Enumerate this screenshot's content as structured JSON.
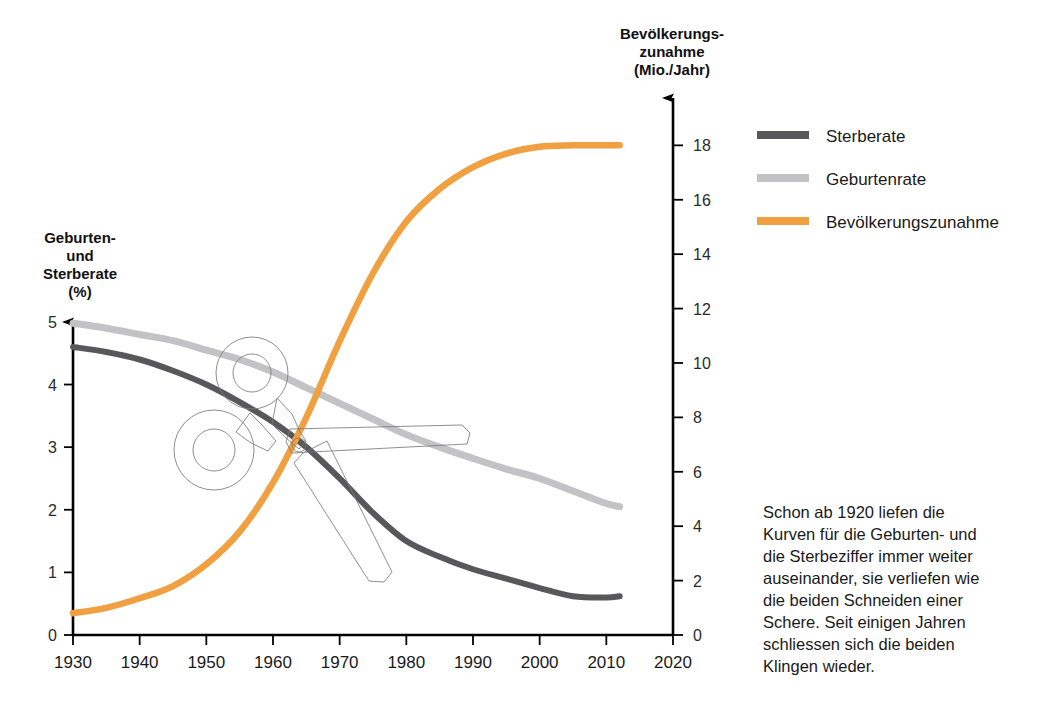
{
  "chart_data": {
    "type": "line",
    "title": "",
    "xlabel": "",
    "x_ticks": [
      1930,
      1940,
      1950,
      1960,
      1970,
      1980,
      1990,
      2000,
      2010,
      2020
    ],
    "xlim": [
      1930,
      2020
    ],
    "grid": false,
    "legend_position": "right",
    "left_axis": {
      "label_line1": "Geburten-",
      "label_line2": "und",
      "label_line3": "Sterberate",
      "label_line4": "(%)",
      "unit": "%",
      "ticks": [
        0,
        1,
        2,
        3,
        4,
        5
      ],
      "ylim": [
        0,
        5.35
      ]
    },
    "right_axis": {
      "label_line1": "Bevölkerungs-",
      "label_line2": "zunahme",
      "label_line3": "(Mio./Jahr)",
      "unit": "Mio./Jahr",
      "ticks": [
        0,
        2,
        4,
        6,
        8,
        10,
        12,
        14,
        16,
        18
      ],
      "ylim": [
        0,
        19.3
      ]
    },
    "series": [
      {
        "name": "Sterberate",
        "axis": "left",
        "color": "#58585a",
        "x": [
          1930,
          1935,
          1940,
          1945,
          1950,
          1955,
          1960,
          1965,
          1970,
          1975,
          1980,
          1985,
          1990,
          1995,
          2000,
          2005,
          2010,
          2012
        ],
        "values": [
          4.6,
          4.52,
          4.4,
          4.22,
          4.0,
          3.72,
          3.4,
          3.0,
          2.5,
          1.95,
          1.5,
          1.25,
          1.05,
          0.9,
          0.75,
          0.62,
          0.6,
          0.62
        ]
      },
      {
        "name": "Geburtenrate",
        "axis": "left",
        "color": "#c3c3c5",
        "x": [
          1930,
          1935,
          1940,
          1945,
          1950,
          1955,
          1960,
          1965,
          1970,
          1975,
          1980,
          1985,
          1990,
          1995,
          2000,
          2005,
          2010,
          2012
        ],
        "values": [
          4.98,
          4.9,
          4.8,
          4.7,
          4.55,
          4.4,
          4.2,
          3.95,
          3.7,
          3.45,
          3.2,
          3.0,
          2.82,
          2.65,
          2.5,
          2.3,
          2.1,
          2.05
        ]
      },
      {
        "name": "Bevölkerungszunahme",
        "axis": "right",
        "color": "#f0a041",
        "x": [
          1930,
          1935,
          1940,
          1945,
          1950,
          1955,
          1960,
          1965,
          1970,
          1975,
          1980,
          1985,
          1990,
          1995,
          2000,
          2005,
          2010,
          2012
        ],
        "values": [
          0.8,
          1.0,
          1.35,
          1.8,
          2.6,
          3.8,
          5.6,
          8.0,
          10.8,
          13.3,
          15.2,
          16.4,
          17.2,
          17.7,
          17.95,
          18.0,
          18.0,
          18.0
        ]
      }
    ],
    "annotations": [
      {
        "name": "scissors-overlay",
        "type": "line-art",
        "description": "Schere"
      }
    ]
  },
  "legend": {
    "items": [
      {
        "label": "Sterberate",
        "color": "#58585a"
      },
      {
        "label": "Geburtenrate",
        "color": "#c3c3c5"
      },
      {
        "label": "Bevölkerungszunahme",
        "color": "#f0a041"
      }
    ]
  },
  "caption": {
    "lines": [
      "Schon ab 1920 liefen die",
      "Kurven für die Geburten- und",
      "die Sterbeziffer immer weiter",
      "auseinander, sie verliefen wie",
      "die beiden Schneiden einer",
      "Schere. Seit einigen Jahren",
      "schliessen sich die beiden",
      "Klingen wieder."
    ]
  },
  "colors": {
    "sterberate": "#58585a",
    "geburtenrate": "#c3c3c5",
    "bevoelkerungszunahme": "#f0a041",
    "axis": "#000000",
    "text": "#1a1a1a"
  }
}
